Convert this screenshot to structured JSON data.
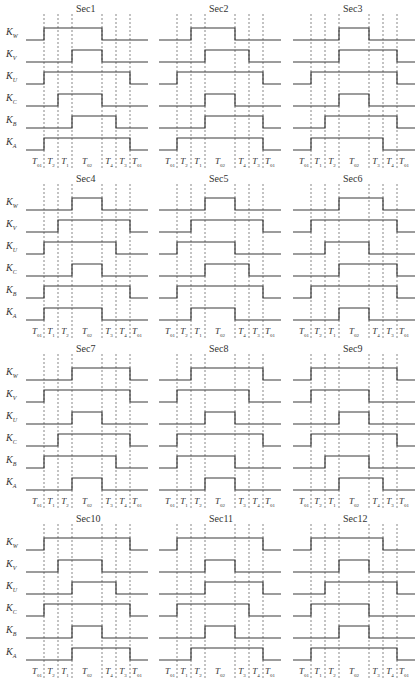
{
  "figure": {
    "signals": [
      "W",
      "V",
      "U",
      "C",
      "B",
      "A"
    ],
    "signal_prefix": "K",
    "line_color": "#3a3a3a",
    "dash_color": "#555555",
    "panels": [
      {
        "title": "Sec1",
        "intervals": [
          "01",
          "2",
          "1",
          "02",
          "4",
          "3",
          "01"
        ],
        "waves": {
          "W": [
            0,
            1,
            1,
            1,
            0,
            0,
            0
          ],
          "V": [
            0,
            0,
            0,
            1,
            0,
            0,
            0
          ],
          "U": [
            0,
            1,
            1,
            1,
            1,
            1,
            0
          ],
          "C": [
            0,
            0,
            1,
            1,
            0,
            0,
            0
          ],
          "B": [
            0,
            0,
            0,
            1,
            1,
            0,
            0
          ],
          "A": [
            0,
            1,
            1,
            1,
            1,
            1,
            0
          ]
        }
      },
      {
        "title": "Sec2",
        "intervals": [
          "01",
          "2",
          "1",
          "02",
          "4",
          "3",
          "01"
        ],
        "waves": {
          "W": [
            0,
            0,
            1,
            1,
            0,
            0,
            0
          ],
          "V": [
            0,
            0,
            0,
            1,
            1,
            0,
            0
          ],
          "U": [
            0,
            1,
            1,
            1,
            1,
            1,
            0
          ],
          "C": [
            0,
            0,
            0,
            1,
            0,
            0,
            0
          ],
          "B": [
            0,
            0,
            0,
            1,
            1,
            1,
            0
          ],
          "A": [
            0,
            1,
            1,
            1,
            1,
            1,
            0
          ]
        }
      },
      {
        "title": "Sec3",
        "intervals": [
          "01",
          "1",
          "2",
          "02",
          "3",
          "4",
          "01"
        ],
        "waves": {
          "W": [
            0,
            0,
            0,
            1,
            0,
            0,
            0
          ],
          "V": [
            0,
            0,
            0,
            1,
            1,
            1,
            0
          ],
          "U": [
            0,
            1,
            1,
            1,
            1,
            1,
            0
          ],
          "C": [
            0,
            0,
            0,
            1,
            0,
            0,
            0
          ],
          "B": [
            0,
            0,
            1,
            1,
            1,
            1,
            0
          ],
          "A": [
            0,
            1,
            1,
            1,
            1,
            0,
            0
          ]
        }
      },
      {
        "title": "Sec4",
        "intervals": [
          "01",
          "1",
          "2",
          "02",
          "3",
          "4",
          "01"
        ],
        "waves": {
          "W": [
            0,
            0,
            0,
            1,
            0,
            0,
            0
          ],
          "V": [
            0,
            0,
            1,
            1,
            1,
            1,
            0
          ],
          "U": [
            0,
            1,
            1,
            1,
            1,
            0,
            0
          ],
          "C": [
            0,
            0,
            0,
            1,
            0,
            0,
            0
          ],
          "B": [
            0,
            1,
            1,
            1,
            1,
            1,
            0
          ],
          "A": [
            0,
            1,
            1,
            1,
            0,
            0,
            0
          ]
        }
      },
      {
        "title": "Sec5",
        "intervals": [
          "01",
          "2",
          "1",
          "02",
          "4",
          "3",
          "01"
        ],
        "waves": {
          "W": [
            0,
            0,
            0,
            1,
            0,
            0,
            0
          ],
          "V": [
            0,
            0,
            1,
            1,
            1,
            1,
            0
          ],
          "U": [
            0,
            1,
            1,
            1,
            0,
            0,
            0
          ],
          "C": [
            0,
            0,
            0,
            1,
            1,
            0,
            0
          ],
          "B": [
            0,
            1,
            1,
            1,
            1,
            1,
            0
          ],
          "A": [
            0,
            0,
            1,
            1,
            0,
            0,
            0
          ]
        }
      },
      {
        "title": "Sec6",
        "intervals": [
          "01",
          "2",
          "1",
          "02",
          "4",
          "3",
          "01"
        ],
        "waves": {
          "W": [
            0,
            0,
            0,
            1,
            1,
            0,
            0
          ],
          "V": [
            0,
            1,
            1,
            1,
            1,
            1,
            0
          ],
          "U": [
            0,
            0,
            1,
            1,
            0,
            0,
            0
          ],
          "C": [
            0,
            0,
            0,
            1,
            1,
            1,
            0
          ],
          "B": [
            0,
            1,
            1,
            1,
            1,
            1,
            0
          ],
          "A": [
            0,
            0,
            0,
            1,
            0,
            0,
            0
          ]
        }
      },
      {
        "title": "Sec7",
        "intervals": [
          "01",
          "1",
          "2",
          "02",
          "3",
          "4",
          "01"
        ],
        "waves": {
          "W": [
            0,
            0,
            0,
            1,
            1,
            1,
            0
          ],
          "V": [
            0,
            1,
            1,
            1,
            1,
            1,
            0
          ],
          "U": [
            0,
            0,
            0,
            1,
            0,
            0,
            0
          ],
          "C": [
            0,
            0,
            1,
            1,
            1,
            1,
            0
          ],
          "B": [
            0,
            1,
            1,
            1,
            1,
            0,
            0
          ],
          "A": [
            0,
            0,
            0,
            1,
            0,
            0,
            0
          ]
        }
      },
      {
        "title": "Sec8",
        "intervals": [
          "01",
          "1",
          "2",
          "02",
          "3",
          "4",
          "01"
        ],
        "waves": {
          "W": [
            0,
            0,
            1,
            1,
            1,
            1,
            0
          ],
          "V": [
            0,
            1,
            1,
            1,
            1,
            0,
            0
          ],
          "U": [
            0,
            0,
            0,
            1,
            0,
            0,
            0
          ],
          "C": [
            0,
            1,
            1,
            1,
            1,
            1,
            0
          ],
          "B": [
            0,
            1,
            1,
            1,
            0,
            0,
            0
          ],
          "A": [
            0,
            0,
            0,
            1,
            0,
            0,
            0
          ]
        }
      },
      {
        "title": "Sec9",
        "intervals": [
          "01",
          "2",
          "1",
          "02",
          "4",
          "3",
          "01"
        ],
        "waves": {
          "W": [
            0,
            1,
            1,
            1,
            1,
            1,
            0
          ],
          "V": [
            0,
            1,
            1,
            1,
            0,
            0,
            0
          ],
          "U": [
            0,
            0,
            0,
            1,
            0,
            0,
            0
          ],
          "C": [
            0,
            1,
            1,
            1,
            1,
            1,
            0
          ],
          "B": [
            0,
            0,
            1,
            1,
            0,
            0,
            0
          ],
          "A": [
            0,
            0,
            0,
            1,
            1,
            0,
            0
          ]
        }
      },
      {
        "title": "Sec10",
        "intervals": [
          "01",
          "2",
          "1",
          "02",
          "4",
          "3",
          "01"
        ],
        "waves": {
          "W": [
            0,
            1,
            1,
            1,
            1,
            1,
            0
          ],
          "V": [
            0,
            0,
            1,
            1,
            0,
            0,
            0
          ],
          "U": [
            0,
            0,
            0,
            1,
            1,
            0,
            0
          ],
          "C": [
            0,
            1,
            1,
            1,
            1,
            1,
            0
          ],
          "B": [
            0,
            0,
            0,
            1,
            0,
            0,
            0
          ],
          "A": [
            0,
            0,
            0,
            1,
            1,
            1,
            0
          ]
        }
      },
      {
        "title": "Sec11",
        "intervals": [
          "01",
          "1",
          "2",
          "02",
          "3",
          "4",
          "01"
        ],
        "waves": {
          "W": [
            0,
            1,
            1,
            1,
            1,
            1,
            0
          ],
          "V": [
            0,
            0,
            0,
            1,
            0,
            0,
            0
          ],
          "U": [
            0,
            0,
            0,
            1,
            1,
            1,
            0
          ],
          "C": [
            0,
            1,
            1,
            1,
            1,
            0,
            0
          ],
          "B": [
            0,
            0,
            0,
            1,
            0,
            0,
            0
          ],
          "A": [
            0,
            0,
            1,
            1,
            1,
            1,
            0
          ]
        }
      },
      {
        "title": "Sec12",
        "intervals": [
          "01",
          "1",
          "2",
          "02",
          "3",
          "4",
          "01"
        ],
        "waves": {
          "W": [
            0,
            1,
            1,
            1,
            1,
            0,
            0
          ],
          "V": [
            0,
            0,
            0,
            1,
            0,
            0,
            0
          ],
          "U": [
            0,
            0,
            1,
            1,
            1,
            1,
            0
          ],
          "C": [
            0,
            1,
            1,
            1,
            0,
            0,
            0
          ],
          "B": [
            0,
            0,
            0,
            1,
            0,
            0,
            0
          ],
          "A": [
            0,
            1,
            1,
            1,
            1,
            1,
            0
          ]
        }
      }
    ]
  }
}
